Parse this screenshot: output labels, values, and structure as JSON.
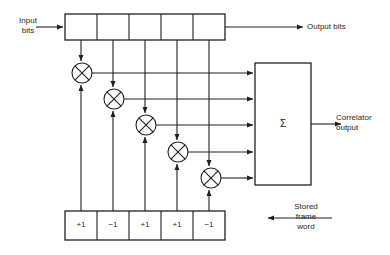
{
  "diagram": {
    "stroke_color": "#231f20",
    "background": "#ffffff",
    "labels": {
      "input_bits": "Input\nbits",
      "output_bits": "Output bits",
      "correlator_output": "Correlator\noutput",
      "stored_frame_word": "Stored\nframe\nword",
      "summer": "Σ"
    },
    "shift_register": {
      "name": "input-shift-register",
      "cell_count": 5,
      "cells": [
        "",
        "",
        "",
        "",
        ""
      ]
    },
    "stored_word_register": {
      "name": "stored-frame-word-register",
      "cell_count": 5,
      "cells": [
        "+1",
        "−1",
        "+1",
        "+1",
        "−1"
      ]
    },
    "multipliers": [
      {
        "name": "multiplier-1",
        "cx": 82,
        "cy": 73,
        "r": 10
      },
      {
        "name": "multiplier-2",
        "cx": 114,
        "cy": 99,
        "r": 10
      },
      {
        "name": "multiplier-3",
        "cx": 146,
        "cy": 125,
        "r": 10
      },
      {
        "name": "multiplier-4",
        "cx": 178,
        "cy": 152,
        "r": 10
      },
      {
        "name": "multiplier-5",
        "cx": 211,
        "cy": 178,
        "r": 10
      }
    ],
    "summer_box": {
      "name": "summing-block",
      "x": 255,
      "y": 63,
      "w": 56,
      "h": 122
    },
    "sum_input_rows": [
      73,
      99,
      125,
      152,
      178
    ]
  }
}
